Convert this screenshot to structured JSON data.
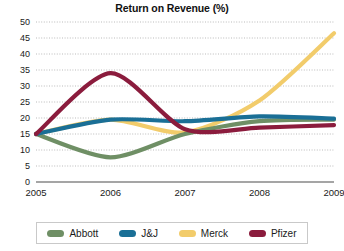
{
  "chart_data": {
    "type": "line",
    "title": "Return on Revenue (%)",
    "xlabel": "",
    "ylabel": "",
    "x": [
      "2005",
      "2006",
      "2007",
      "2008",
      "2009"
    ],
    "categories": [
      "2005",
      "2006",
      "2007",
      "2008",
      "2009"
    ],
    "ylim": [
      0,
      50
    ],
    "ytick_step": 5,
    "yticks": [
      0,
      5,
      10,
      15,
      20,
      25,
      30,
      35,
      40,
      45,
      50
    ],
    "ytick_labels": [
      "0",
      "5",
      "10",
      "15",
      "20",
      "25",
      "30",
      "35",
      "40",
      "45",
      "50"
    ],
    "grid": true,
    "grid_axis": "y",
    "legend_position": "bottom",
    "series": [
      {
        "name": "Abbott",
        "color": "#6f8f65",
        "values": [
          15.0,
          7.7,
          15.0,
          19.0,
          19.5
        ]
      },
      {
        "name": "J&J",
        "color": "#1a6f96",
        "values": [
          15.0,
          19.5,
          19.0,
          20.5,
          19.8
        ]
      },
      {
        "name": "Merck",
        "color": "#f2cc6b",
        "values": [
          15.0,
          19.5,
          15.5,
          25.5,
          46.5
        ]
      },
      {
        "name": "Pfizer",
        "color": "#8b1c3d",
        "values": [
          15.0,
          34.0,
          16.5,
          17.0,
          17.8
        ]
      }
    ]
  },
  "legend": {
    "items": [
      {
        "label": "Abbott",
        "color": "#6f8f65"
      },
      {
        "label": "J&J",
        "color": "#1a6f96"
      },
      {
        "label": "Merck",
        "color": "#f2cc6b"
      },
      {
        "label": "Pfizer",
        "color": "#8b1c3d"
      }
    ]
  },
  "colors": {
    "grid": "#b3b3b3",
    "axis": "#4d4d4d",
    "background": "#ffffff",
    "text": "#1a1a1a"
  }
}
